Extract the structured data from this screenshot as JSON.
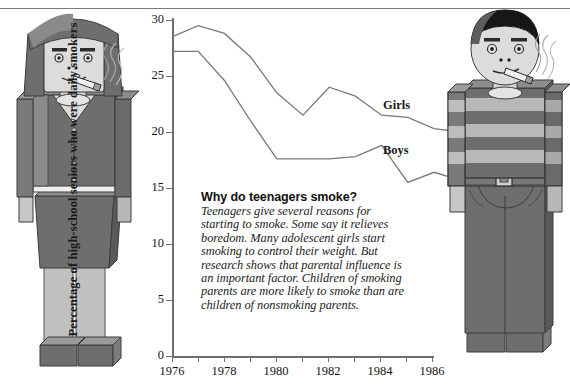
{
  "chart_data": {
    "type": "line",
    "title": "",
    "xlabel": "",
    "ylabel": "Percentage of high-school seniors who were daily smokers",
    "x": [
      1976,
      1977,
      1978,
      1979,
      1980,
      1981,
      1982,
      1983,
      1984,
      1985,
      1986,
      1987
    ],
    "xticks": [
      1976,
      1978,
      1980,
      1982,
      1984,
      1986
    ],
    "yticks": [
      0,
      5,
      10,
      15,
      20,
      25,
      30
    ],
    "ylim": [
      0,
      30
    ],
    "xlim": [
      1976,
      1987
    ],
    "grid": false,
    "legend_position": "inline-right",
    "series": [
      {
        "name": "Girls",
        "values": [
          28.5,
          29.5,
          28.8,
          26.7,
          23.5,
          21.5,
          24.0,
          23.2,
          21.5,
          21.3,
          20.3,
          20.0
        ]
      },
      {
        "name": "Boys",
        "values": [
          27.2,
          27.2,
          24.6,
          21.0,
          17.6,
          17.6,
          17.6,
          17.8,
          18.8,
          15.5,
          16.4,
          15.7
        ]
      }
    ]
  },
  "axis": {
    "y_title": "Percentage of high-school seniors who were daily smokers",
    "y_tick_labels": [
      "30",
      "25",
      "20",
      "15",
      "10",
      "5",
      "0"
    ],
    "x_tick_labels": [
      "1976",
      "1978",
      "1980",
      "1982",
      "1984",
      "1986"
    ]
  },
  "series_labels": {
    "girls": "Girls",
    "boys": "Boys"
  },
  "callout": {
    "heading": "Why do teenagers smoke?",
    "body": "Teenagers give several reasons for starting to smoke. Some say it relieves boredom. Many adolescent girls start smoking to control their weight. But research shows that parental influence is an important factor. Children of smoking parents are more likely to smoke than are children of nonsmoking parents."
  },
  "figures": {
    "left": {
      "name": "girl-smoking-figure",
      "description": "Wooden-doll girl with bobbed hair, jacket, skirt, holding a lit cigarette"
    },
    "right": {
      "name": "boy-smoking-figure",
      "description": "Wooden-doll boy with short hair, striped shirt, jeans, holding a lit cigarette"
    }
  },
  "colors": {
    "line": "#7a7a7a",
    "axis": "#6d6d6d",
    "text": "#141414",
    "figure_dark": "#6e6e6e",
    "figure_mid": "#8f8f8f",
    "figure_light": "#c9c9c9",
    "skin": "#d6d6d6",
    "hair_dark": "#575757",
    "hair_black": "#171717"
  }
}
